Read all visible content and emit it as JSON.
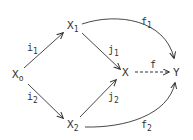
{
  "diagram": {
    "type": "commutative-diagram",
    "nodes": {
      "x0": {
        "base": "X",
        "sub": "o"
      },
      "x1": {
        "base": "X",
        "sub": "1"
      },
      "x2": {
        "base": "X",
        "sub": "2"
      },
      "x": {
        "base": "X",
        "sub": ""
      },
      "y": {
        "base": "Y",
        "sub": ""
      }
    },
    "edges": {
      "i1": {
        "base": "i",
        "sub": "1",
        "from": "X0",
        "to": "X1",
        "style": "solid"
      },
      "i2": {
        "base": "i",
        "sub": "2",
        "from": "X0",
        "to": "X2",
        "style": "solid"
      },
      "j1": {
        "base": "j",
        "sub": "1",
        "from": "X1",
        "to": "X",
        "style": "solid"
      },
      "j2": {
        "base": "j",
        "sub": "2",
        "from": "X2",
        "to": "X",
        "style": "solid"
      },
      "f": {
        "base": "f",
        "sub": "",
        "from": "X",
        "to": "Y",
        "style": "dashed"
      },
      "f1": {
        "base": "f",
        "sub": "1",
        "from": "X1",
        "to": "Y",
        "style": "curved"
      },
      "f2": {
        "base": "f",
        "sub": "2",
        "from": "X2",
        "to": "Y",
        "style": "curved"
      }
    },
    "colors": {
      "ink": "#333333",
      "background": "#ffffff"
    }
  }
}
